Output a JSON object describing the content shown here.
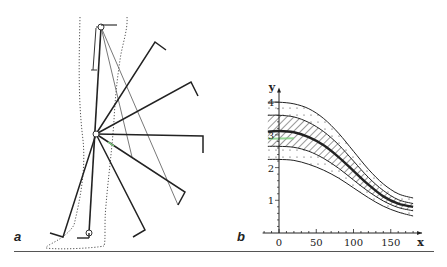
{
  "figure": {
    "panels": [
      {
        "id": "a",
        "label": "a",
        "description": "Schematic of leg (dotted outline) with pendulum-like bar positions swung about the knee pivot"
      },
      {
        "id": "b",
        "label": "b",
        "description": "Band plot of y vs x: central mean curve, hatched inner band, dotted outer band"
      }
    ]
  },
  "panel_a": {
    "label": "a",
    "pivot": {
      "x": 96,
      "y": 134
    },
    "bars_thick": [
      {
        "end": [
          155,
          42
        ],
        "hook": [
          166,
          50
        ]
      },
      {
        "end": [
          191,
          82
        ],
        "hook": [
          198,
          96
        ]
      },
      {
        "end": [
          203,
          136
        ],
        "hook": [
          203,
          153
        ]
      },
      {
        "end": [
          185,
          192
        ],
        "hook": [
          178,
          205
        ]
      },
      {
        "end": [
          145,
          230
        ],
        "hook": [
          133,
          237
        ]
      },
      {
        "end": [
          63,
          237
        ],
        "hook": [
          50,
          233
        ]
      }
    ],
    "bars_thin": [
      {
        "from": [
          101,
          27
        ],
        "to": [
          132,
          157
        ]
      },
      {
        "from": [
          101,
          27
        ],
        "to": [
          178,
          205
        ]
      }
    ],
    "vertical_bar": {
      "top": [
        101,
        27
      ],
      "bottom": [
        89,
        233
      ]
    }
  },
  "chart_data": {
    "type": "line",
    "title": "",
    "xlabel": "x",
    "ylabel": "y",
    "xlim": [
      -20,
      190
    ],
    "ylim": [
      0,
      4.4
    ],
    "xticks": [
      0,
      50,
      100,
      150
    ],
    "yticks": [
      1,
      2,
      3,
      4
    ],
    "xtick_labels": [
      "0",
      "50",
      "100",
      "150"
    ],
    "ytick_labels": [
      "1",
      "2",
      "3",
      "4"
    ],
    "grid": false,
    "legend": null,
    "x": [
      -15,
      0,
      20,
      40,
      60,
      80,
      100,
      120,
      140,
      160,
      180
    ],
    "series": [
      {
        "name": "outer-upper",
        "style": "thin",
        "values": [
          4.0,
          4.0,
          3.95,
          3.8,
          3.5,
          3.05,
          2.5,
          1.95,
          1.5,
          1.2,
          1.07
        ]
      },
      {
        "name": "inner-upper",
        "style": "thin",
        "values": [
          3.6,
          3.6,
          3.55,
          3.38,
          3.1,
          2.7,
          2.2,
          1.7,
          1.3,
          1.02,
          0.9
        ]
      },
      {
        "name": "mean",
        "style": "thick",
        "values": [
          3.1,
          3.12,
          3.08,
          2.93,
          2.68,
          2.32,
          1.9,
          1.48,
          1.12,
          0.9,
          0.8
        ]
      },
      {
        "name": "inner-lower",
        "style": "thin",
        "values": [
          2.65,
          2.65,
          2.62,
          2.5,
          2.28,
          1.98,
          1.62,
          1.27,
          0.98,
          0.78,
          0.68
        ]
      },
      {
        "name": "outer-lower",
        "style": "thin",
        "values": [
          2.25,
          2.25,
          2.22,
          2.1,
          1.92,
          1.68,
          1.38,
          1.08,
          0.82,
          0.64,
          0.52
        ]
      }
    ],
    "bands": [
      {
        "between": [
          "inner-upper",
          "inner-lower"
        ],
        "fill": "hatched"
      },
      {
        "between": [
          "outer-upper",
          "inner-upper"
        ],
        "fill": "dotted"
      },
      {
        "between": [
          "inner-lower",
          "outer-lower"
        ],
        "fill": "dotted"
      }
    ],
    "layout": {
      "origin_px": [
        279,
        233
      ],
      "px_per_x": 0.745,
      "px_per_y": 32.7
    }
  },
  "colors": {
    "ink": "#222222",
    "outline": "#555555",
    "hatch": "#333333",
    "mark_green": "#7fcf7f"
  }
}
